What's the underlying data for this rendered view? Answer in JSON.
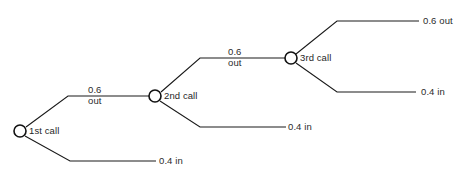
{
  "diagram": {
    "type": "probability-tree-diagram",
    "nodes": [
      {
        "id": "n1",
        "label": "1st call",
        "x": 20,
        "y": 131
      },
      {
        "id": "n2",
        "label": "2nd call",
        "x": 155,
        "y": 96
      },
      {
        "id": "n3",
        "label": "3rd call",
        "x": 291,
        "y": 58
      }
    ],
    "edge_labels": [
      {
        "id": "e1",
        "prob": "0.6",
        "outcome": "out",
        "x": 88,
        "y": 84
      },
      {
        "id": "e2",
        "prob": "0.6",
        "outcome": "out",
        "x": 228,
        "y": 46
      }
    ],
    "leaf_labels": [
      {
        "id": "l1",
        "text": "0.6 out",
        "x": 423,
        "y": 13
      },
      {
        "id": "l2",
        "text": "0.4 in",
        "x": 421,
        "y": 89
      },
      {
        "id": "l3",
        "text": "0.4 in",
        "x": 288,
        "y": 122
      },
      {
        "id": "l4",
        "text": "0.4 in",
        "x": 159,
        "y": 156
      }
    ],
    "colors": {
      "line": "#1a1a1a",
      "node_stroke": "#111111",
      "node_fill": "#ffffff",
      "text": "#2b2b2b",
      "background": "#ffffff"
    },
    "geometry": {
      "node_radius": 6,
      "edges": [
        {
          "id": "edge-1st-out",
          "points": "26,127 68,96 149,96"
        },
        {
          "id": "edge-1st-in",
          "points": "25,136 70,161 156,161"
        },
        {
          "id": "edge-2nd-out",
          "points": "161,92 200,58 285,58"
        },
        {
          "id": "edge-2nd-in",
          "points": "160,101 200,127 286,127"
        },
        {
          "id": "edge-3rd-out",
          "points": "296,54 337,21 419,21"
        },
        {
          "id": "edge-3rd-in",
          "points": "296,63 337,92 416,92"
        }
      ]
    }
  }
}
